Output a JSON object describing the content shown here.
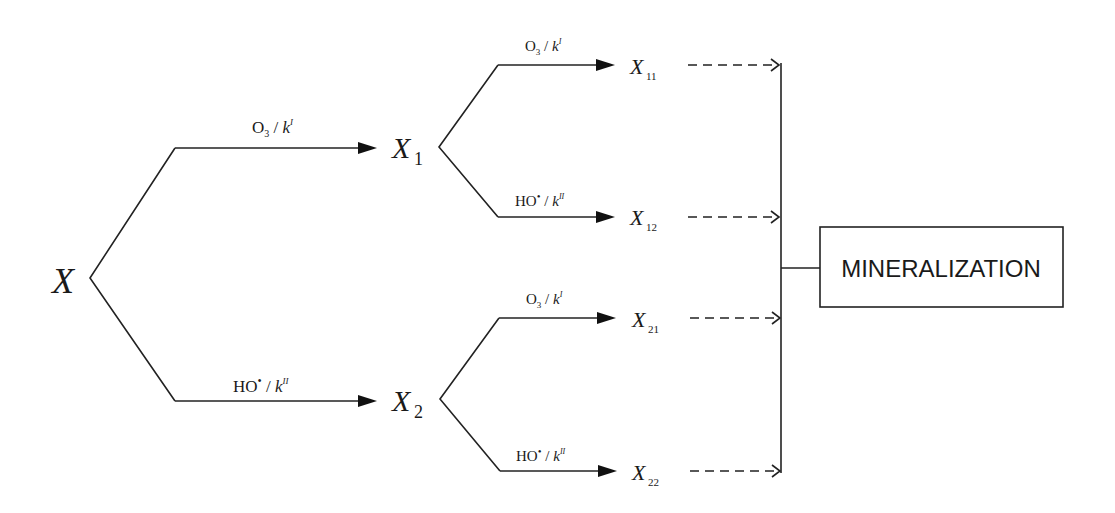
{
  "diagram": {
    "type": "reaction-pathway",
    "nodes": {
      "root": {
        "label": "X",
        "sub": ""
      },
      "x1": {
        "label": "X",
        "sub": "1"
      },
      "x2": {
        "label": "X",
        "sub": "2"
      },
      "x11": {
        "label": "X",
        "sub": "11"
      },
      "x12": {
        "label": "X",
        "sub": "12"
      },
      "x21": {
        "label": "X",
        "sub": "21"
      },
      "x22": {
        "label": "X",
        "sub": "22"
      },
      "sink": {
        "label": "MINERALIZATION"
      }
    },
    "edge_labels": {
      "ozone": {
        "species": "O",
        "species_sub": "3",
        "sep": " / ",
        "k": "k",
        "k_sup": "I"
      },
      "hydroxyl": {
        "species": "HO",
        "species_sup": "•",
        "sep": " / ",
        "k": "k",
        "k_sup": "II"
      }
    },
    "edges": [
      {
        "from": "X",
        "to": "X1",
        "label": "O3 / kI",
        "style": "solid"
      },
      {
        "from": "X",
        "to": "X2",
        "label": "HO• / kII",
        "style": "solid"
      },
      {
        "from": "X1",
        "to": "X11",
        "label": "O3 / kI",
        "style": "solid"
      },
      {
        "from": "X1",
        "to": "X12",
        "label": "HO• / kII",
        "style": "solid"
      },
      {
        "from": "X2",
        "to": "X21",
        "label": "O3 / kI",
        "style": "solid"
      },
      {
        "from": "X2",
        "to": "X22",
        "label": "HO• / kII",
        "style": "solid"
      },
      {
        "from": "X11",
        "to": "MINERALIZATION",
        "style": "dashed"
      },
      {
        "from": "X12",
        "to": "MINERALIZATION",
        "style": "dashed"
      },
      {
        "from": "X21",
        "to": "MINERALIZATION",
        "style": "dashed"
      },
      {
        "from": "X22",
        "to": "MINERALIZATION",
        "style": "dashed"
      }
    ]
  }
}
